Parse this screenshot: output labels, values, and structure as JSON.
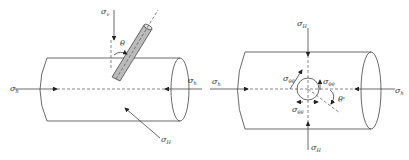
{
  "figure": {
    "left_panel": {
      "labels": {
        "sigma_v": {
          "symbol": "σ",
          "sub": "v"
        },
        "sigma_h_left": {
          "symbol": "σ",
          "sub": "h"
        },
        "sigma_h_right": {
          "symbol": "σ",
          "sub": "h"
        },
        "sigma_H": {
          "symbol": "σ",
          "sub": "H"
        },
        "theta": "θ"
      },
      "borehole_color": "#bbbbbb"
    },
    "right_panel": {
      "labels": {
        "sigma_H_top": {
          "symbol": "σ",
          "sub": "H"
        },
        "sigma_H_bottom": {
          "symbol": "σ",
          "sub": "H"
        },
        "sigma_h_left": {
          "symbol": "σ",
          "sub": "h"
        },
        "sigma_h_right": {
          "symbol": "σ",
          "sub": "h"
        },
        "sigma_theta_1": {
          "symbol": "σ",
          "sub": "θθ"
        },
        "sigma_theta_2": {
          "symbol": "σ",
          "sub": "θθ"
        },
        "sigma_theta_3": {
          "symbol": "σ",
          "sub": "θθ"
        },
        "theta_prime": "θ'"
      }
    }
  }
}
